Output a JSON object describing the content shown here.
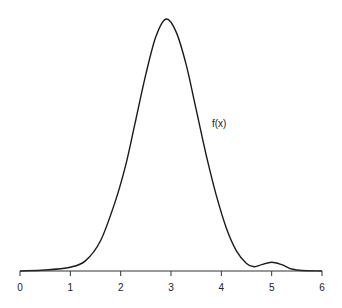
{
  "chart_data": {
    "type": "line",
    "title": "",
    "xlabel": "",
    "ylabel": "",
    "xlim": [
      0,
      6
    ],
    "grid": false,
    "x_ticks": [
      "0",
      "1",
      "2",
      "3",
      "4",
      "5",
      "6"
    ],
    "annotations": [
      {
        "text": "f(x)",
        "x": 4.0,
        "y_frac": 0.56
      }
    ],
    "series": [
      {
        "name": "f(x)",
        "x": [
          0,
          0.5,
          1.0,
          1.3,
          1.6,
          1.9,
          2.1,
          2.3,
          2.5,
          2.7,
          2.9,
          3.1,
          3.3,
          3.5,
          3.7,
          3.9,
          4.1,
          4.3,
          4.5,
          4.65,
          4.8,
          5.0,
          5.2,
          5.4,
          5.6,
          6.0
        ],
        "values": [
          0.0,
          0.004,
          0.015,
          0.04,
          0.12,
          0.28,
          0.42,
          0.6,
          0.78,
          0.93,
          1.0,
          0.95,
          0.82,
          0.64,
          0.46,
          0.3,
          0.17,
          0.08,
          0.03,
          0.017,
          0.025,
          0.035,
          0.025,
          0.008,
          0.002,
          0.0
        ]
      }
    ]
  },
  "labels": {
    "annotation": "f(x)",
    "ticks": [
      "0",
      "1",
      "2",
      "3",
      "4",
      "5",
      "6"
    ]
  }
}
